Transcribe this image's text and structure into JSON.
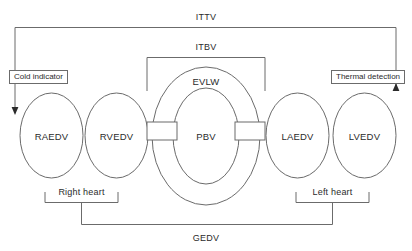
{
  "figure": {
    "background_color": "#ffffff",
    "line_color": "#6b6b6b",
    "text_color": "#2b2b2b"
  },
  "chambers": [
    {
      "id": "raedv",
      "label": "RAEDV",
      "name": "Right atrial end-diastolic volume"
    },
    {
      "id": "rvedv",
      "label": "RVEDV",
      "name": "Right ventricular end-diastolic volume"
    },
    {
      "id": "evlw",
      "label": "EVLW",
      "name": "Extravascular lung water"
    },
    {
      "id": "pbv",
      "label": "PBV",
      "name": "Pulmonary blood volume"
    },
    {
      "id": "laedv",
      "label": "LAEDV",
      "name": "Left atrial end-diastolic volume"
    },
    {
      "id": "lvedv",
      "label": "LVEDV",
      "name": "Left ventricular end-diastolic volume"
    }
  ],
  "brackets": {
    "ittv": {
      "label": "ITTV",
      "name": "Intrathoracic thermal volume"
    },
    "itbv": {
      "label": "ITBV",
      "name": "Intrathoracic blood volume"
    },
    "gedv": {
      "label": "GEDV",
      "name": "Global end-diastolic volume"
    },
    "right_heart": {
      "label": "Right heart"
    },
    "left_heart": {
      "label": "Left heart"
    }
  },
  "callouts": {
    "cold_indicator": {
      "label": "Cold indicator"
    },
    "thermal_detection": {
      "label": "Thermal detection"
    }
  }
}
